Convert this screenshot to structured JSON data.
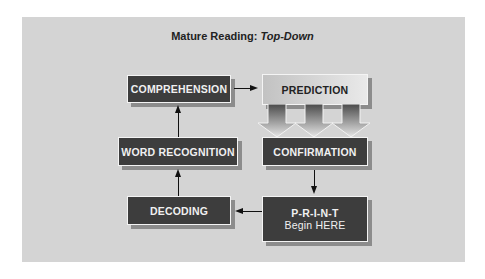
{
  "title": {
    "prefix": "Mature Reading: ",
    "emphasis": "Top-Down"
  },
  "nodes": {
    "comprehension": "COMPREHENSION",
    "prediction": "PREDICTION",
    "word_recognition": "WORD RECOGNITION",
    "confirmation": "CONFIRMATION",
    "decoding": "DECODING",
    "print": {
      "line1": "P-R-I-N-T",
      "line2": "Begin HERE"
    }
  },
  "edges": [
    {
      "from": "print",
      "to": "decoding"
    },
    {
      "from": "decoding",
      "to": "word_recognition"
    },
    {
      "from": "word_recognition",
      "to": "comprehension"
    },
    {
      "from": "comprehension",
      "to": "prediction"
    },
    {
      "from": "prediction",
      "to": "confirmation",
      "style": "three block arrows"
    },
    {
      "from": "confirmation",
      "to": "print"
    }
  ],
  "colors": {
    "panel": "#d4d4d4",
    "dark_box": "#3d3d3d",
    "light_box": "#dcdcdc"
  }
}
